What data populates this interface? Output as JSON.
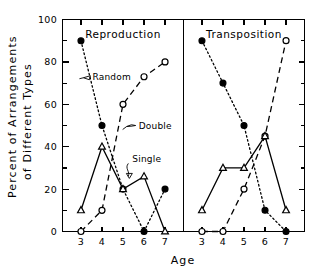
{
  "chart_data": {
    "type": "line",
    "title": "",
    "xlabel": "Age",
    "ylabel": "Percent of Arrangements of Different Types",
    "ylabel_line1": "Percent  of  Arrangements",
    "ylabel_line2": "of  Different  Types",
    "x": [
      3,
      4,
      5,
      6,
      7
    ],
    "xtick_labels": [
      "3",
      "4",
      "5",
      "6",
      "7"
    ],
    "ytick_labels": [
      "0",
      "20",
      "40",
      "60",
      "80",
      "100"
    ],
    "ytick_values": [
      0,
      20,
      40,
      60,
      80,
      100
    ],
    "yminor_values": [
      10,
      30,
      50,
      70,
      90
    ],
    "ylim": [
      0,
      100
    ],
    "xlim": [
      2.55,
      7.45
    ],
    "grid": false,
    "legend_position": "inline-annotations",
    "panels": [
      {
        "name": "reproduction",
        "title": "Reproduction",
        "series": [
          {
            "name": "Random",
            "marker": "filled-circle",
            "linestyle": "dotted",
            "values": [
              90,
              50,
              20,
              0,
              20
            ]
          },
          {
            "name": "Double",
            "marker": "open-circle",
            "linestyle": "dashed",
            "values": [
              0,
              10,
              60,
              73,
              80
            ]
          },
          {
            "name": "Single",
            "marker": "open-triangle",
            "linestyle": "solid",
            "values": [
              10,
              40,
              20,
              26,
              0
            ]
          }
        ],
        "annotations": [
          {
            "name": "Random",
            "label": "Random",
            "x": 3.45,
            "y": 73
          },
          {
            "name": "Double",
            "label": "Double",
            "x": 5.65,
            "y": 50
          },
          {
            "name": "Single",
            "label": "Single",
            "x": 5.35,
            "y": 34
          }
        ]
      },
      {
        "name": "transposition",
        "title": "Transposition",
        "series": [
          {
            "name": "Random",
            "marker": "filled-circle",
            "linestyle": "dotted",
            "values": [
              90,
              70,
              50,
              10,
              0
            ]
          },
          {
            "name": "Double",
            "marker": "open-circle",
            "linestyle": "dashed",
            "values": [
              0,
              0,
              20,
              45,
              90
            ]
          },
          {
            "name": "Single",
            "marker": "open-triangle",
            "linestyle": "solid",
            "values": [
              10,
              30,
              30,
              45,
              10
            ]
          }
        ],
        "annotations": []
      }
    ]
  },
  "colors": {
    "foreground": "#000000",
    "background": "#ffffff"
  }
}
